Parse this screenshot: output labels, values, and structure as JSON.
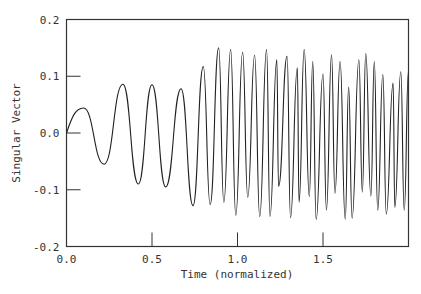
{
  "chart_data": {
    "type": "line",
    "title": "",
    "xlabel": "Time (normalized)",
    "ylabel": "Singular Vector",
    "xlim": [
      0.0,
      2.0
    ],
    "ylim": [
      -0.2,
      0.2
    ],
    "xticks": [
      0.0,
      0.5,
      1.0,
      1.5
    ],
    "xtick_labels": [
      "0.0",
      "0.5",
      "1.0",
      "1.5"
    ],
    "yticks": [
      -0.2,
      -0.1,
      0.0,
      0.1,
      0.2
    ],
    "ytick_labels": [
      "-0.2",
      "-0.1",
      "0.0",
      "0.1",
      "0.2"
    ],
    "grid": false,
    "legend": null,
    "series": [
      {
        "name": "Singular Vector",
        "color": "#222222",
        "x": [
          0.0,
          0.1,
          0.22,
          0.33,
          0.42,
          0.5,
          0.58,
          0.67,
          0.74,
          0.8,
          0.84,
          0.89,
          0.92,
          0.96,
          0.99,
          1.03,
          1.06,
          1.1,
          1.13,
          1.17,
          1.19,
          1.23,
          1.24,
          1.29,
          1.31,
          1.35,
          1.36,
          1.39,
          1.42,
          1.44,
          1.46,
          1.5,
          1.52,
          1.55,
          1.57,
          1.6,
          1.63,
          1.65,
          1.67,
          1.71,
          1.73,
          1.75,
          1.78,
          1.8,
          1.82,
          1.85,
          1.87,
          1.91,
          1.92,
          1.955,
          1.975,
          2.0
        ],
        "y": [
          0.0,
          0.044,
          -0.055,
          0.086,
          -0.09,
          0.085,
          -0.095,
          0.078,
          -0.128,
          0.117,
          -0.126,
          0.15,
          -0.122,
          0.147,
          -0.145,
          0.142,
          -0.113,
          0.137,
          -0.147,
          0.147,
          -0.147,
          0.129,
          -0.094,
          0.135,
          -0.149,
          0.115,
          -0.122,
          0.147,
          -0.112,
          0.126,
          -0.152,
          0.104,
          -0.136,
          0.138,
          -0.106,
          0.126,
          -0.152,
          0.081,
          -0.15,
          0.129,
          -0.104,
          0.14,
          -0.111,
          0.126,
          -0.136,
          0.103,
          -0.143,
          0.088,
          -0.131,
          0.108,
          -0.136,
          0.11
        ]
      }
    ]
  }
}
